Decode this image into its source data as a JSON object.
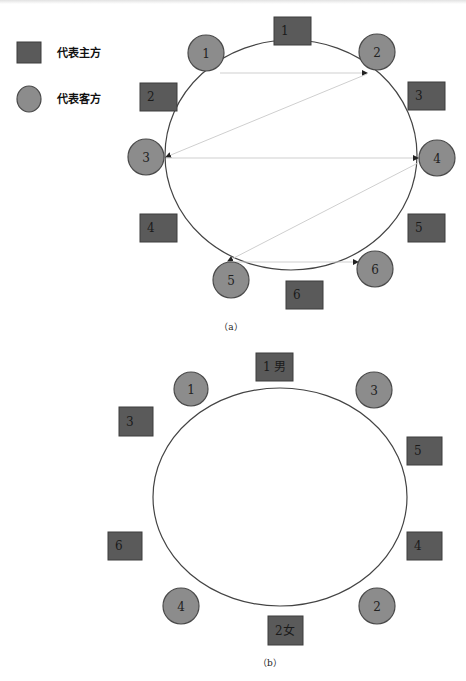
{
  "legend": {
    "host_label": "代表主方",
    "guest_label": "代表客方"
  },
  "colors": {
    "host_fill": "#5a5a5a",
    "guest_fill": "#8c8c8c",
    "table_stroke": "#444444",
    "arrow_line": "#cfcfcf"
  },
  "diagram_a": {
    "caption": "（a）",
    "hosts": [
      {
        "label": "1",
        "x": 274,
        "y": 17,
        "w": 37,
        "h": 28
      },
      {
        "label": "2",
        "x": 140,
        "y": 83,
        "w": 37,
        "h": 28
      },
      {
        "label": "3",
        "x": 408,
        "y": 82,
        "w": 37,
        "h": 28
      },
      {
        "label": "4",
        "x": 140,
        "y": 214,
        "w": 37,
        "h": 28
      },
      {
        "label": "5",
        "x": 408,
        "y": 214,
        "w": 37,
        "h": 28
      },
      {
        "label": "6",
        "x": 286,
        "y": 281,
        "w": 37,
        "h": 28
      }
    ],
    "guests": [
      {
        "label": "1",
        "cx": 206,
        "cy": 53,
        "r": 18
      },
      {
        "label": "2",
        "cx": 377,
        "cy": 52,
        "r": 18
      },
      {
        "label": "3",
        "cx": 146,
        "cy": 157,
        "r": 18
      },
      {
        "label": "4",
        "cx": 437,
        "cy": 158,
        "r": 18
      },
      {
        "label": "5",
        "cx": 231,
        "cy": 280,
        "r": 18
      },
      {
        "label": "6",
        "cx": 375,
        "cy": 269,
        "r": 18
      }
    ],
    "arrows": [
      {
        "from": "guest-1",
        "to": "guest-2",
        "x1": 220,
        "y1": 73,
        "x2": 367,
        "y2": 73
      },
      {
        "from": "guest-2",
        "to": "guest-3",
        "x1": 367,
        "y1": 74,
        "x2": 166,
        "y2": 157
      },
      {
        "from": "guest-3",
        "to": "guest-4",
        "x1": 166,
        "y1": 158,
        "x2": 418,
        "y2": 158
      },
      {
        "from": "guest-4",
        "to": "guest-5",
        "x1": 418,
        "y1": 163,
        "x2": 228,
        "y2": 261
      },
      {
        "from": "guest-5",
        "to": "guest-6",
        "x1": 232,
        "y1": 262,
        "x2": 358,
        "y2": 262
      }
    ],
    "table": {
      "cx": 291,
      "cy": 155,
      "rx": 126,
      "ry": 115
    }
  },
  "diagram_b": {
    "caption": "（b）",
    "hosts": [
      {
        "label": "1 男",
        "x": 256,
        "y": 353,
        "w": 37,
        "h": 28
      },
      {
        "label": "3",
        "x": 119,
        "y": 407,
        "w": 34,
        "h": 29
      },
      {
        "label": "5",
        "x": 407,
        "y": 437,
        "w": 35,
        "h": 28
      },
      {
        "label": "6",
        "x": 108,
        "y": 532,
        "w": 34,
        "h": 28
      },
      {
        "label": "4",
        "x": 407,
        "y": 532,
        "w": 35,
        "h": 28
      },
      {
        "label": "2女",
        "x": 268,
        "y": 616,
        "w": 35,
        "h": 29
      }
    ],
    "guests": [
      {
        "label": "1",
        "cx": 191,
        "cy": 389,
        "r": 17
      },
      {
        "label": "3",
        "cx": 374,
        "cy": 390,
        "r": 18
      },
      {
        "label": "4",
        "cx": 181,
        "cy": 606,
        "r": 18
      },
      {
        "label": "2",
        "cx": 377,
        "cy": 606,
        "r": 18
      }
    ],
    "table": {
      "cx": 280,
      "cy": 497,
      "rx": 127,
      "ry": 109
    }
  }
}
